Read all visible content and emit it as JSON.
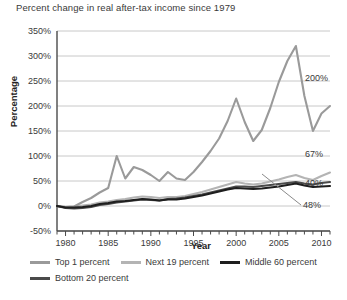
{
  "chart_data": {
    "type": "line",
    "title": "Percent change in real after-tax income since 1979",
    "xlabel": "Year",
    "ylabel": "Percentage",
    "xlim": [
      1979,
      2011
    ],
    "ylim": [
      -50,
      350
    ],
    "ytick_step": 50,
    "ytick_labels": [
      "350%",
      "300%",
      "250%",
      "200%",
      "150%",
      "100%",
      "50%",
      "0%",
      "-50%"
    ],
    "ytick_values": [
      350,
      300,
      250,
      200,
      150,
      100,
      50,
      0,
      -50
    ],
    "xtick_labels": [
      "1980",
      "1985",
      "1990",
      "1995",
      "2000",
      "2005",
      "2010"
    ],
    "xtick_values": [
      1980,
      1985,
      1990,
      1995,
      2000,
      2005,
      2010
    ],
    "x": [
      1979,
      1980,
      1981,
      1982,
      1983,
      1984,
      1985,
      1986,
      1987,
      1988,
      1989,
      1990,
      1991,
      1992,
      1993,
      1994,
      1995,
      1996,
      1997,
      1998,
      1999,
      2000,
      2001,
      2002,
      2003,
      2004,
      2005,
      2006,
      2007,
      2008,
      2009,
      2010,
      2011
    ],
    "grid": true,
    "legend_position": "bottom-left",
    "series": [
      {
        "name": "Top 1 percent",
        "color": "#9a9a9a",
        "end_label": "200%",
        "end_value": 200,
        "values": [
          0,
          -2,
          -1,
          8,
          16,
          27,
          36,
          100,
          55,
          78,
          72,
          62,
          50,
          68,
          55,
          52,
          68,
          88,
          110,
          135,
          170,
          215,
          168,
          130,
          152,
          196,
          248,
          290,
          320,
          220,
          150,
          185,
          200
        ]
      },
      {
        "name": "Next 19 percent",
        "color": "#b4b4b4",
        "end_label": "67%",
        "end_value": 67,
        "values": [
          0,
          -2,
          -1,
          1,
          3,
          7,
          9,
          12,
          14,
          17,
          19,
          18,
          16,
          18,
          18,
          20,
          24,
          28,
          33,
          38,
          43,
          48,
          45,
          43,
          45,
          49,
          53,
          58,
          62,
          56,
          52,
          60,
          67
        ]
      },
      {
        "name": "Middle 60 percent",
        "color": "#1e1e1e",
        "end_label": "40%",
        "end_value": 40,
        "values": [
          0,
          -3,
          -3,
          -2,
          0,
          4,
          6,
          9,
          10,
          12,
          14,
          13,
          11,
          13,
          13,
          15,
          18,
          21,
          25,
          29,
          33,
          36,
          35,
          34,
          35,
          37,
          39,
          42,
          45,
          41,
          38,
          39,
          40
        ]
      },
      {
        "name": "Bottom 20 percent",
        "color": "#4a4a4a",
        "end_label": "48%",
        "end_value": 48,
        "values": [
          0,
          -4,
          -5,
          -4,
          -2,
          2,
          4,
          7,
          9,
          11,
          13,
          12,
          11,
          14,
          15,
          17,
          20,
          23,
          27,
          31,
          35,
          39,
          39,
          38,
          40,
          42,
          44,
          46,
          48,
          45,
          43,
          46,
          48
        ]
      }
    ],
    "annotations": [
      {
        "label": "200%",
        "series": "Top 1 percent",
        "value": 200
      },
      {
        "label": "67%",
        "series": "Next 19 percent",
        "value": 67
      },
      {
        "label": "40%",
        "series": "Middle 60 percent",
        "value": 40
      },
      {
        "label": "48%",
        "series": "Bottom 20 percent",
        "value": 48
      }
    ]
  },
  "legend": {
    "row1": [
      {
        "label": "Top 1 percent",
        "color": "#9a9a9a"
      },
      {
        "label": "Next 19 percent",
        "color": "#b4b4b4"
      },
      {
        "label": "Middle 60 percent",
        "color": "#1e1e1e"
      }
    ],
    "row2": [
      {
        "label": "Bottom 20 percent",
        "color": "#4a4a4a"
      }
    ]
  },
  "style": {
    "grid_color": "#c8c8c8",
    "axis_color": "#4a4a4a",
    "background": "#ffffff"
  }
}
